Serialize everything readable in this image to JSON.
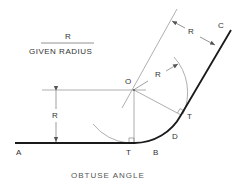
{
  "diagram": {
    "title": "OBTUSE ANGLE",
    "legend": {
      "numerator": "R",
      "denominator": "GIVEN RADIUS"
    },
    "points": {
      "A": "A",
      "B": "B",
      "C": "C",
      "D": "D",
      "O": "O",
      "T1": "T",
      "T2": "T"
    },
    "dimensions": {
      "vertical_radius": "R",
      "offset_radius": "R",
      "arc_radius": "R"
    },
    "colors": {
      "bold_line": "#1a1a1a",
      "construction_line": "#9a9a9a",
      "text": "#333333"
    }
  }
}
